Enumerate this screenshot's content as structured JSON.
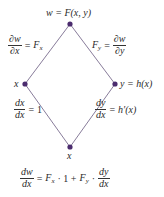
{
  "diagram": {
    "type": "tree-diagram",
    "node_color": "#4b2c6e",
    "edge_color": "#6a5a80",
    "nodes": [
      {
        "id": "top",
        "label": "w = F(x, y)",
        "x": 70,
        "y": 24
      },
      {
        "id": "left",
        "label": "x",
        "x": 25,
        "y": 84
      },
      {
        "id": "right",
        "label": "y = h(x)",
        "x": 115,
        "y": 84
      },
      {
        "id": "bottom",
        "label": "x",
        "x": 70,
        "y": 147
      }
    ],
    "edges": [
      {
        "from": "top",
        "to": "left",
        "label": {
          "num": "∂w",
          "den": "∂x",
          "rhs": "F",
          "rhs_sub": "x"
        }
      },
      {
        "from": "top",
        "to": "right",
        "label": {
          "lhs": "F",
          "lhs_sub": "y",
          "num": "∂w",
          "den": "∂y"
        }
      },
      {
        "from": "left",
        "to": "bottom",
        "label": {
          "num": "dx",
          "den": "dx",
          "rhs": "1"
        }
      },
      {
        "from": "right",
        "to": "bottom",
        "label": {
          "num": "dy",
          "den": "dx",
          "rhs": "h′(x)"
        }
      }
    ]
  },
  "formula": {
    "lhs_num": "dw",
    "lhs_den": "dx",
    "equals": "=",
    "term1": "F",
    "term1_sub": "x",
    "term1_mult": "· 1 +",
    "term2": "F",
    "term2_sub": "y",
    "term2_mult": "·",
    "rhs_num": "dy",
    "rhs_den": "dx"
  }
}
